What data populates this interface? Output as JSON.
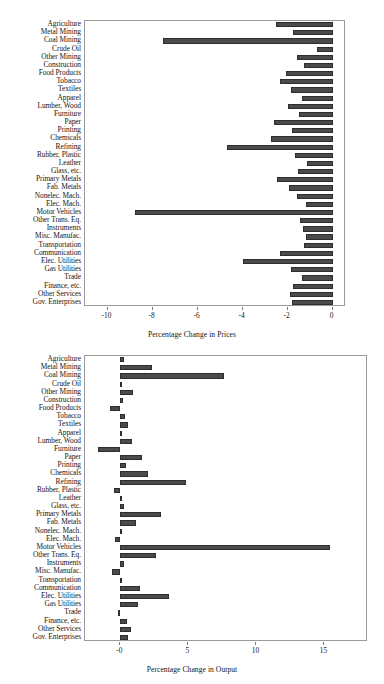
{
  "figure": {
    "title": "",
    "panels": [
      "prices",
      "output"
    ]
  },
  "chart_data": [
    {
      "type": "bar",
      "orientation": "horizontal",
      "title": "",
      "xlabel": "Percentage Change in Prices",
      "ylabel": "",
      "grid": false,
      "legend": null,
      "xlim": [
        -11.0,
        0.6
      ],
      "xticks": [
        -10,
        -8,
        -6,
        -4,
        -2,
        0
      ],
      "xticklabels": [
        "-10",
        "-8",
        "-6",
        "-4",
        "-2",
        "0"
      ],
      "categories": [
        "Agriculture",
        "Metal Mining",
        "Coal Mining",
        "Crude Oil",
        "Other Mining",
        "Construction",
        "Food Products",
        "Tobacco",
        "Textiles",
        "Apparel",
        "Lumber, Wood",
        "Furniture",
        "Paper",
        "Printing",
        "Chemicals",
        "Refining",
        "Rubber, Plastic",
        "Leather",
        "Glass, etc.",
        "Primary Metals",
        "Fab. Metals",
        "Nonelec. Mach.",
        "Elec. Mach.",
        "Motor Vehicles",
        "Other Trans. Eq.",
        "Instruments",
        "Misc. Manufac.",
        "Transportation",
        "Communication",
        "Elec. Utilities",
        "Gas Utilities",
        "Trade",
        "Finance, etc.",
        "Other Services",
        "Gov. Enterprises"
      ],
      "values": [
        -2.5,
        -1.75,
        -7.55,
        -0.7,
        -1.6,
        -1.25,
        -2.05,
        -2.35,
        -1.85,
        -1.35,
        -2.0,
        -1.5,
        -2.6,
        -1.8,
        -2.75,
        -4.7,
        -1.65,
        -1.15,
        -1.55,
        -2.45,
        -1.95,
        -1.6,
        -1.2,
        -8.8,
        -1.45,
        -1.3,
        -1.2,
        -1.25,
        -2.35,
        -4.0,
        -1.85,
        -1.35,
        -1.75,
        -1.9,
        -1.8
      ]
    },
    {
      "type": "bar",
      "orientation": "horizontal",
      "title": "",
      "xlabel": "Percentage Change in Output",
      "ylabel": "",
      "grid": false,
      "legend": null,
      "xlim": [
        -2.6,
        18.2
      ],
      "xticks": [
        0,
        5,
        10,
        15
      ],
      "xticklabels": [
        "-0",
        "5",
        "10",
        "15"
      ],
      "categories": [
        "Agriculture",
        "Metal Mining",
        "Coal Mining",
        "Crude Oil",
        "Other Mining",
        "Construction",
        "Food Products",
        "Tobacco",
        "Textiles",
        "Apparel",
        "Lumber, Wood",
        "Furniture",
        "Paper",
        "Printing",
        "Chemicals",
        "Refining",
        "Rubber, Plastic",
        "Leather",
        "Glass, etc.",
        "Primary Metals",
        "Fab. Metals",
        "Nonelec. Mach.",
        "Elec. Mach.",
        "Motor Vehicles",
        "Other Trans. Eq.",
        "Instruments",
        "Misc. Manufac.",
        "Transportation",
        "Communication",
        "Elec. Utilities",
        "Gas Utilities",
        "Trade",
        "Finance, etc.",
        "Other Services",
        "Gov. Enterprises"
      ],
      "values": [
        0.25,
        2.35,
        7.6,
        0.05,
        0.9,
        0.2,
        -0.75,
        0.35,
        0.55,
        0.0,
        0.85,
        -1.65,
        1.6,
        0.4,
        2.0,
        4.85,
        -0.45,
        0.05,
        0.3,
        3.0,
        1.15,
        0.02,
        -0.4,
        15.4,
        2.65,
        0.25,
        -0.6,
        0.05,
        1.45,
        3.6,
        1.3,
        -0.2,
        0.5,
        0.75,
        0.55
      ]
    }
  ],
  "colors": {
    "bar_fill": "#4a4a4a",
    "bar_edge": "#2e2e2e",
    "frame": "#9a9a9a",
    "text": "#161616",
    "background": "#ffffff"
  }
}
